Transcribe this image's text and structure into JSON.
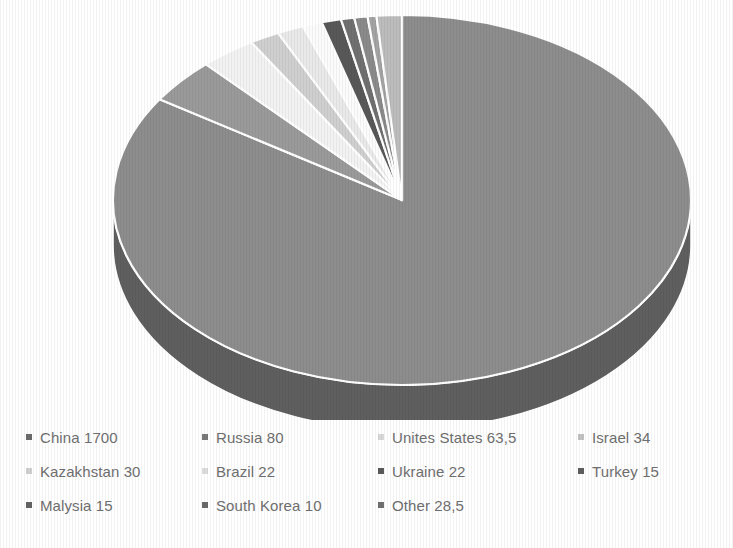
{
  "chart_data": {
    "type": "pie",
    "title": "",
    "subtitle": "",
    "xlabel": "",
    "ylabel": "",
    "grid": false,
    "legend_position": "bottom",
    "style": "3d-exploded-none-grayscale",
    "total": 2020,
    "value_format": "comma-decimal",
    "categories": [
      "China",
      "Russia",
      "Unites States",
      "Israel",
      "Kazakhstan",
      "Brazil",
      "Ukraine",
      "Turkey",
      "Malysia",
      "South Korea",
      "Other"
    ],
    "labels": [
      "China 1700",
      "Russia 80",
      "Unites States 63,5",
      "Israel 34",
      "Kazakhstan 30",
      "Brazil 22",
      "Ukraine 22",
      "Turkey 15",
      "Malysia 15",
      "South Korea 10",
      "Other 28,5"
    ],
    "values": [
      1700,
      80,
      63.5,
      34,
      30,
      22,
      22,
      15,
      15,
      10,
      28.5
    ],
    "value_strings": [
      "1700",
      "80",
      "63,5",
      "34",
      "30",
      "22",
      "22",
      "15",
      "15",
      "10",
      "28,5"
    ],
    "percentages": [
      84.2,
      4.0,
      3.1,
      1.7,
      1.5,
      1.1,
      1.1,
      0.7,
      0.7,
      0.5,
      1.4
    ],
    "slice_colors": [
      "#8d8d8d",
      "#9a9a9a",
      "#f2f2f2",
      "#cfcfcf",
      "#e9e9e9",
      "#fbfbfb",
      "#585858",
      "#707070",
      "#8a8a8a",
      "#a3a3a3",
      "#bcbcbc"
    ],
    "slice_side_colors": [
      "#5f5f5f",
      "#6b6b6b",
      "#c9c9c9",
      "#a6a6a6",
      "#bdbdbd",
      "#d2d2d2",
      "#3b3b3b",
      "#4c4c4c",
      "#5e5e5e",
      "#727272",
      "#8a8a8a"
    ]
  },
  "legend": {
    "marker_icon": "square-marker",
    "items": [
      {
        "label": "China 1700",
        "color": "#6b6b6b"
      },
      {
        "label": "Russia 80",
        "color": "#7a7a7a"
      },
      {
        "label": "Unites States 63,5",
        "color": "#d8d8d8"
      },
      {
        "label": "Israel 34",
        "color": "#c2c2c2"
      },
      {
        "label": "Kazakhstan 30",
        "color": "#d0d0d0"
      },
      {
        "label": "Brazil 22",
        "color": "#dcdcdc"
      },
      {
        "label": "Ukraine 22",
        "color": "#5a5a5a"
      },
      {
        "label": "Turkey 15",
        "color": "#5f5f5f"
      },
      {
        "label": "Malysia 15",
        "color": "#636363"
      },
      {
        "label": "South Korea 10",
        "color": "#6a6a6a"
      },
      {
        "label": "Other 28,5",
        "color": "#707070"
      }
    ]
  },
  "canvas": {
    "background": "#ffffff",
    "text_color": "#6f6f6f"
  }
}
